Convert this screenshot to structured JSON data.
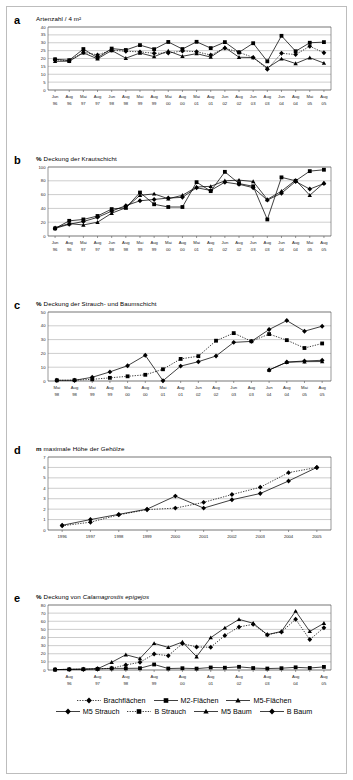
{
  "figure": {
    "panel_letters": [
      "a",
      "b",
      "c",
      "d",
      "e"
    ]
  },
  "legend": {
    "rows": [
      [
        {
          "label": "Brachflächen",
          "marker": "diamond",
          "line": "dotted"
        },
        {
          "label": "M2-Flächen",
          "marker": "square",
          "line": "solid"
        },
        {
          "label": "M5-Flächen",
          "marker": "triangle",
          "line": "solid"
        }
      ],
      [
        {
          "label": "M5 Strauch",
          "marker": "diamond",
          "line": "solid"
        },
        {
          "label": "B Strauch",
          "marker": "square",
          "line": "dotted"
        },
        {
          "label": "M5 Baum",
          "marker": "triangle",
          "line": "solid"
        },
        {
          "label": "B Baum",
          "marker": "diamond",
          "line": "solid"
        }
      ]
    ]
  },
  "chart_data": [
    {
      "panel": "a",
      "type": "line",
      "title": "Artenzahl / 4 m²",
      "unit": "",
      "xlabel": "",
      "ylabel": "Artenzahl / 4 m²",
      "ylim": [
        0,
        40
      ],
      "yticks": [
        0,
        5,
        10,
        15,
        20,
        25,
        30,
        35,
        40
      ],
      "grid": true,
      "categories": [
        "Jun 96",
        "Aug 96",
        "Mai 97",
        "Aug 97",
        "Jun 98",
        "Aug 98",
        "Mai 99",
        "Aug 99",
        "Mai 00",
        "Aug 00",
        "Mai 01",
        "Aug 01",
        "Jun 02",
        "Aug 02",
        "Jun 03",
        "Aug 03",
        "Jun 04",
        "Aug 04",
        "Mai 05",
        "Aug 05"
      ],
      "tick_labels_top": [
        "Jun",
        "Aug",
        "Mai",
        "Aug",
        "Jun",
        "Aug",
        "Mai",
        "Aug",
        "Mai",
        "Aug",
        "Mai",
        "Aug",
        "Jun",
        "Aug",
        "Jun",
        "Aug",
        "Jun",
        "Aug",
        "Mai",
        "Aug"
      ],
      "tick_labels_bottom": [
        "96",
        "96",
        "97",
        "97",
        "98",
        "98",
        "99",
        "99",
        "00",
        "00",
        "01",
        "01",
        "02",
        "02",
        "03",
        "03",
        "04",
        "04",
        "05",
        "05"
      ],
      "series": [
        {
          "name": "Brachflächen",
          "marker": "diamond",
          "line": "dotted",
          "values": [
            19.2,
            18.6,
            24.0,
            22.3,
            25.3,
            24.6,
            24.2,
            23.3,
            23.5,
            24.8,
            24.3,
            22.2,
            26.6,
            23.9,
            20.7,
            13.2,
            23.3,
            22.5,
            27.8,
            23.6
          ]
        },
        {
          "name": "M2-Flächen",
          "marker": "square",
          "line": "solid",
          "values": [
            19.5,
            18.9,
            26.0,
            20.5,
            26.3,
            25.4,
            28.5,
            25.9,
            30.5,
            26.0,
            30.6,
            26.6,
            30.4,
            23.9,
            29.7,
            18.2,
            34.4,
            24.6,
            30.0,
            30.4
          ]
        },
        {
          "name": "M5-Flächen",
          "marker": "triangle",
          "line": "solid",
          "values": [
            18.2,
            18.3,
            23.6,
            19.8,
            25.1,
            20.2,
            23.5,
            21.2,
            24.8,
            21.4,
            23.1,
            20.9,
            27.0,
            20.8,
            20.6,
            14.0,
            19.8,
            16.8,
            20.5,
            17.1
          ]
        }
      ]
    },
    {
      "panel": "b",
      "type": "line",
      "title": "Deckung der Krautschicht",
      "unit": "%",
      "xlabel": "",
      "ylabel": "% Deckung der Krautschicht",
      "ylim": [
        0,
        100
      ],
      "yticks": [
        0,
        20,
        40,
        60,
        80,
        100
      ],
      "grid": true,
      "categories": [
        "Jun 96",
        "Aug 96",
        "Mai 97",
        "Aug 97",
        "Jun 98",
        "Aug 98",
        "Mai 99",
        "Aug 99",
        "Mai 00",
        "Aug 00",
        "Mai 01",
        "Aug 01",
        "Jun 02",
        "Aug 02",
        "Jun 03",
        "Aug 03",
        "Jun 04",
        "Aug 04",
        "Mai 05",
        "Aug 05"
      ],
      "tick_labels_top": [
        "Jun",
        "Aug",
        "Mai",
        "Aug",
        "Jun",
        "Aug",
        "Mai",
        "Aug",
        "Mai",
        "Aug",
        "Mai",
        "Aug",
        "Jun",
        "Aug",
        "Jun",
        "Aug",
        "Jun",
        "Aug",
        "Mai",
        "Aug"
      ],
      "tick_labels_bottom": [
        "96",
        "96",
        "97",
        "97",
        "98",
        "98",
        "99",
        "99",
        "00",
        "00",
        "01",
        "01",
        "02",
        "02",
        "03",
        "03",
        "04",
        "04",
        "05",
        "05"
      ],
      "series": [
        {
          "name": "Brachflächen",
          "marker": "diamond",
          "line": "solid",
          "values": [
            11,
            17,
            21,
            27,
            36,
            44,
            51,
            53,
            55,
            56,
            70,
            66,
            78,
            75,
            70,
            52,
            62,
            79,
            68,
            76
          ]
        },
        {
          "name": "M2-Flächen",
          "marker": "square",
          "line": "solid",
          "values": [
            11,
            22,
            24,
            29,
            39,
            41,
            63,
            46,
            42,
            42,
            78,
            65,
            93,
            76,
            72,
            24,
            85,
            80,
            94,
            96
          ]
        },
        {
          "name": "M5-Flächen",
          "marker": "triangle",
          "line": "solid",
          "values": [
            12,
            18,
            16,
            20,
            33,
            41,
            59,
            61,
            54,
            59,
            71,
            72,
            80,
            81,
            79,
            53,
            65,
            81,
            59,
            77
          ]
        }
      ]
    },
    {
      "panel": "c",
      "type": "line",
      "title": "Deckung der Strauch- und Baumschicht",
      "unit": "%",
      "xlabel": "",
      "ylabel": "% Deckung der Strauch- und Baumschicht",
      "ylim": [
        0,
        50
      ],
      "yticks": [
        0,
        10,
        20,
        30,
        40,
        50
      ],
      "grid": true,
      "categories": [
        "Mai 98",
        "Aug 98",
        "Mai 99",
        "Aug 99",
        "Mai 00",
        "Aug 00",
        "Mai 01",
        "Aug 01",
        "Jun 02",
        "Aug 02",
        "Jun 03",
        "Aug 03",
        "Jun 04",
        "Aug 04",
        "Mai 05",
        "Aug 05"
      ],
      "tick_labels_top": [
        "Mai",
        "Aug",
        "Mai",
        "Aug",
        "Mai",
        "Aug",
        "Mai",
        "Aug",
        "Jun",
        "Aug",
        "Jun",
        "Aug",
        "Jun",
        "Aug",
        "Mai",
        "Aug"
      ],
      "tick_labels_bottom": [
        "98",
        "98",
        "99",
        "99",
        "00",
        "00",
        "01",
        "01",
        "02",
        "02",
        "03",
        "03",
        "04",
        "04",
        "05",
        "05"
      ],
      "series": [
        {
          "name": "B Strauch",
          "marker": "square",
          "line": "dotted",
          "values": [
            0.5,
            0.6,
            1.2,
            2.3,
            3.4,
            4.5,
            8.5,
            16.0,
            18.0,
            29.2,
            34.7,
            28.8,
            34.0,
            29.6,
            23.9,
            27.2
          ]
        },
        {
          "name": "B Baum",
          "marker": "diamond",
          "line": "solid",
          "values": [
            0.5,
            0.5,
            2.7,
            6.6,
            11.1,
            18.6,
            0.2,
            10.8,
            14.0,
            18.1,
            28.0,
            28.7,
            37.3,
            43.8,
            36.1,
            39.7
          ]
        },
        {
          "name": "M5 Strauch",
          "marker": "diamond",
          "line": "solid",
          "values": [
            null,
            null,
            null,
            null,
            null,
            null,
            null,
            null,
            null,
            null,
            null,
            null,
            8.0,
            13.7,
            14.5,
            15.0
          ]
        },
        {
          "name": "M5 Baum",
          "marker": "triangle",
          "line": "solid",
          "values": [
            null,
            null,
            null,
            null,
            null,
            null,
            null,
            null,
            null,
            null,
            null,
            null,
            8.0,
            13.6,
            14.0,
            14.1
          ]
        }
      ]
    },
    {
      "panel": "d",
      "type": "line",
      "title": "maximale Höhe der Gehölze",
      "unit": "m",
      "xlabel": "",
      "ylabel": "m maximale Höhe der Gehölze",
      "ylim": [
        0,
        7
      ],
      "yticks": [
        0,
        1,
        2,
        3,
        4,
        5,
        6,
        7
      ],
      "grid": true,
      "categories": [
        "1996",
        "1997",
        "1998",
        "1999",
        "2000",
        "2001",
        "2002",
        "2003",
        "2004",
        "2005"
      ],
      "tick_labels_top": [
        "1996",
        "1997",
        "1998",
        "1999",
        "2000",
        "2001",
        "2002",
        "2003",
        "2004",
        "2005"
      ],
      "tick_labels_bottom": [
        "",
        "",
        "",
        "",
        "",
        "",
        "",
        "",
        "",
        ""
      ],
      "series": [
        {
          "name": "Brachflächen",
          "marker": "diamond",
          "line": "dotted",
          "values": [
            0.4,
            0.75,
            1.45,
            1.95,
            2.1,
            2.65,
            3.4,
            4.1,
            5.5,
            6.0
          ]
        },
        {
          "name": "Gehölze",
          "marker": "diamond",
          "line": "solid",
          "values": [
            0.45,
            1.0,
            1.5,
            2.0,
            3.25,
            2.1,
            2.9,
            3.5,
            4.7,
            6.0
          ]
        }
      ]
    },
    {
      "panel": "e",
      "type": "line",
      "title": "Deckung von Calamagrostis epigejos",
      "title_italic": "Calamagrostis epigejos",
      "unit": "%",
      "xlabel": "",
      "ylabel": "% Deckung von Calamagrostis epigejos",
      "ylim": [
        0,
        80
      ],
      "yticks": [
        0,
        10,
        20,
        30,
        40,
        50,
        60,
        70,
        80
      ],
      "grid": true,
      "categories": [
        "Aug 96",
        "",
        "Aug 97",
        "",
        "Aug 98",
        "",
        "Aug 99",
        "",
        "Aug 00",
        "",
        "Aug 01",
        "",
        "Aug 02",
        "",
        "Aug 03",
        "",
        "Aug 04",
        "",
        "Aug 05",
        ""
      ],
      "tick_labels_top": [
        "Aug",
        "Aug",
        "Aug",
        "Aug",
        "Aug",
        "Aug",
        "Aug",
        "Aug",
        "Aug",
        "Aug"
      ],
      "tick_labels_bottom": [
        "96",
        "97",
        "98",
        "99",
        "00",
        "01",
        "02",
        "03",
        "04",
        "05"
      ],
      "series": [
        {
          "name": "Brachflächen",
          "marker": "diamond",
          "line": "dotted",
          "values": [
            0.5,
            0.8,
            1.0,
            1.5,
            2.2,
            6.2,
            9.5,
            19.6,
            17.6,
            32.5,
            28.4,
            28.0,
            42.5,
            53.0,
            56.2,
            43.5,
            46.8,
            62.5,
            37.5,
            52.0
          ]
        },
        {
          "name": "M2-Flächen",
          "marker": "square",
          "line": "solid",
          "values": [
            0.5,
            0.8,
            1.0,
            1.4,
            2.0,
            2.0,
            2.2,
            6.8,
            1.8,
            2.2,
            1.7,
            3.1,
            2.8,
            3.9,
            2.4,
            1.8,
            2.2,
            3.3,
            2.5,
            3.8
          ]
        },
        {
          "name": "M5-Flächen",
          "marker": "triangle",
          "line": "solid",
          "values": [
            0.5,
            0.8,
            1.0,
            1.5,
            9.5,
            18.8,
            14.2,
            32.8,
            27.8,
            34.5,
            16.4,
            39.8,
            51.8,
            62.3,
            57.5,
            43.5,
            47.5,
            72.5,
            47.5,
            57.5
          ]
        }
      ]
    }
  ]
}
